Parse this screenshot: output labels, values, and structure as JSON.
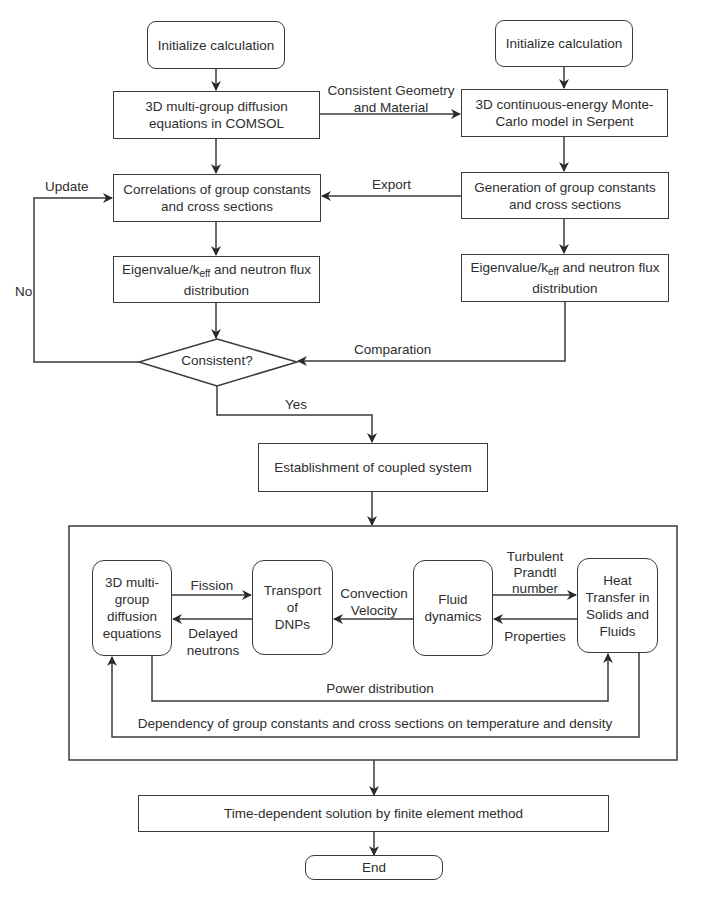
{
  "nodes": {
    "init_left": "Initialize calculation",
    "init_right": "Initialize calculation",
    "diffusion_comsol_l1": "3D multi-group diffusion",
    "diffusion_comsol_l2": "equations in COMSOL",
    "montecarlo_l1": "3D continuous-energy Monte-",
    "montecarlo_l2": "Carlo model in Serpent",
    "correlations_l1": "Correlations of group constants",
    "correlations_l2": "and cross sections",
    "generation_l1": "Generation of group constants",
    "generation_l2": "and cross sections",
    "eigen_left_pre": "Eigenvalue/k",
    "eigen_left_sub": "eff",
    "eigen_left_post": " and neutron flux",
    "eigen_left_l2": "distribution",
    "eigen_right_pre": "Eigenvalue/k",
    "eigen_right_sub": "eff",
    "eigen_right_post": " and neutron flux",
    "eigen_right_l2": "distribution",
    "decision": "Consistent?",
    "coupled": "Establishment of coupled system",
    "inner_diffusion": [
      "3D multi-",
      "group",
      "diffusion",
      "equations"
    ],
    "transport": [
      "Transport of",
      "DNPs"
    ],
    "fluid": [
      "Fluid",
      "dynamics"
    ],
    "heat": [
      "Heat",
      "Transfer in",
      "Solids and",
      "Fluids"
    ],
    "time_solution": "Time-dependent solution by finite element method",
    "end": "End"
  },
  "edge_labels": {
    "geometry_l1": "Consistent Geometry",
    "geometry_l2": "and Material",
    "export": "Export",
    "update": "Update",
    "no": "No",
    "comparation": "Comparation",
    "yes": "Yes",
    "fission": "Fission",
    "delayed_l1": "Delayed",
    "delayed_l2": "neutrons",
    "convection_l1": "Convection",
    "convection_l2": "Velocity",
    "prandtl_l1": "Turbulent",
    "prandtl_l2": "Prandtl",
    "prandtl_l3": "number",
    "properties": "Properties",
    "power": "Power distribution",
    "dependency": "Dependency of group constants and cross sections on temperature and density"
  },
  "colors": {
    "stroke": "#3a3a3a",
    "text": "#2e2e2e",
    "background": "#ffffff"
  }
}
